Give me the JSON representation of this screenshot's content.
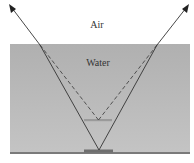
{
  "diagram": {
    "labels": {
      "air": "Air",
      "water": "Water"
    },
    "elements": {
      "object": "object on bottom",
      "image": "apparent (virtual) image",
      "real_rays": "refracted rays (solid, with arrowheads)",
      "virtual_rays": "extrapolated rays (dashed)"
    },
    "colors": {
      "water": "#b3b3b3",
      "bottom": "#7a7a7a",
      "object": "#6e6e6e",
      "image": "#9a9a9a",
      "ray": "#333333",
      "text": "#333333"
    }
  }
}
